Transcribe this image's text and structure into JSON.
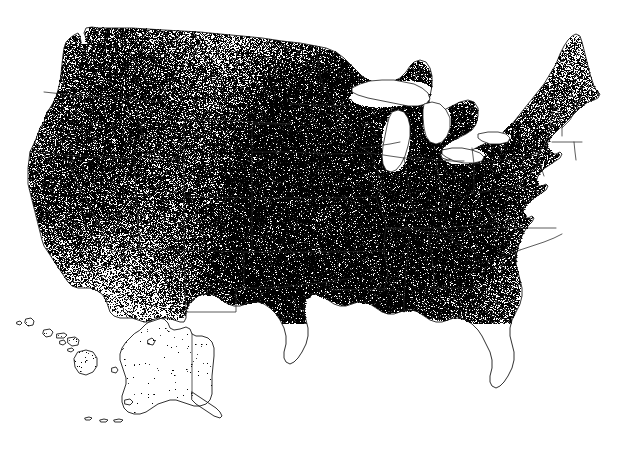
{
  "figure": {
    "type": "dot-density-map",
    "title": "",
    "caption": "",
    "region": "United States",
    "projection": "Albers Equal Area Conic",
    "has_title": false,
    "has_legend": false,
    "has_axis_labels": false,
    "has_text_labels": false,
    "insets": [
      "Alaska",
      "Hawaii"
    ],
    "background_color": "#ffffff",
    "dot_color": "#000000",
    "boundary_color": "#262626",
    "coastline_color": "#1a1a1a"
  },
  "chart_data": {
    "type": "scatter",
    "title": "",
    "subtitle": "",
    "xlabel": "",
    "ylabel": "",
    "grid": false,
    "legend_position": "none",
    "symbol": "dot",
    "symbol_color": "#000000",
    "symbol_size_px": 1,
    "xlim": [
      0,
      626
    ],
    "ylim": [
      0,
      453
    ],
    "density_scale": {
      "min_label": "sparse",
      "max_label": "dense",
      "levels": [
        "very low",
        "low",
        "moderate",
        "high",
        "very high"
      ]
    },
    "regions": [
      {
        "name": "Corn Belt (IA, IL, IN, OH, MO)",
        "density": "very high",
        "relative_density": 1.0,
        "cx": 355,
        "cy": 180
      },
      {
        "name": "Southern Minnesota / Eastern Dakotas",
        "density": "very high",
        "relative_density": 0.92,
        "cx": 315,
        "cy": 120
      },
      {
        "name": "Kentucky / Tennessee",
        "density": "high",
        "relative_density": 0.78,
        "cx": 405,
        "cy": 215
      },
      {
        "name": "Eastern Kansas / Nebraska",
        "density": "high",
        "relative_density": 0.72,
        "cx": 300,
        "cy": 195
      },
      {
        "name": "Lower Michigan / Wisconsin",
        "density": "high",
        "relative_density": 0.66,
        "cx": 390,
        "cy": 150
      },
      {
        "name": "Pennsylvania / New York",
        "density": "moderate",
        "relative_density": 0.5,
        "cx": 510,
        "cy": 150
      },
      {
        "name": "Mississippi Delta",
        "density": "high",
        "relative_density": 0.7,
        "cx": 370,
        "cy": 250
      },
      {
        "name": "Southeast Piedmont (NC, SC, GA, AL)",
        "density": "moderate",
        "relative_density": 0.45,
        "cx": 455,
        "cy": 250
      },
      {
        "name": "Central Valley, California",
        "density": "very high",
        "relative_density": 0.95,
        "cx": 55,
        "cy": 200
      },
      {
        "name": "Palouse / Columbia Plateau (WA, ID)",
        "density": "high",
        "relative_density": 0.8,
        "cx": 110,
        "cy": 55
      },
      {
        "name": "Snake River Plain, Idaho",
        "density": "moderate",
        "relative_density": 0.55,
        "cx": 145,
        "cy": 130
      },
      {
        "name": "Texas High Plains / Panhandle",
        "density": "very high",
        "relative_density": 0.9,
        "cx": 248,
        "cy": 275
      },
      {
        "name": "Central Texas / Blackland Prairie",
        "density": "moderate",
        "relative_density": 0.48,
        "cx": 300,
        "cy": 320
      },
      {
        "name": "Florida Peninsula",
        "density": "low",
        "relative_density": 0.2,
        "cx": 505,
        "cy": 340
      },
      {
        "name": "Great Basin (NV, UT)",
        "density": "very low",
        "relative_density": 0.05,
        "cx": 120,
        "cy": 190
      },
      {
        "name": "Interior West (WY, MT, CO)",
        "density": "very low",
        "relative_density": 0.07,
        "cx": 185,
        "cy": 150
      },
      {
        "name": "Desert Southwest (AZ, NM)",
        "density": "very low",
        "relative_density": 0.05,
        "cx": 175,
        "cy": 265
      },
      {
        "name": "Northern New England (ME, NH, VT)",
        "density": "low",
        "relative_density": 0.15,
        "cx": 560,
        "cy": 85
      },
      {
        "name": "Alaska (inset)",
        "density": "very low",
        "relative_density": 0.01,
        "cx": 160,
        "cy": 375
      },
      {
        "name": "Hawaii (inset)",
        "density": "very low",
        "relative_density": 0.01,
        "cx": 55,
        "cy": 340
      }
    ]
  }
}
